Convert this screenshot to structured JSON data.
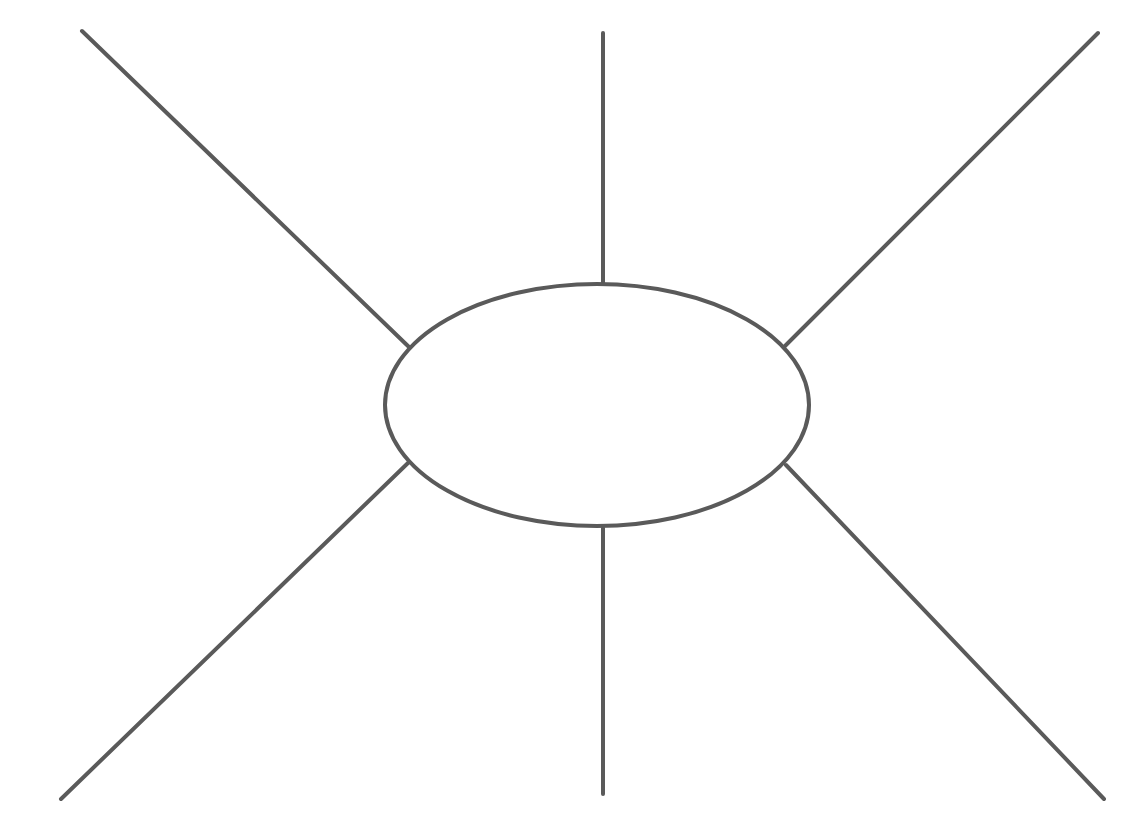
{
  "diagram": {
    "type": "spider-map",
    "stroke_color": "#5a5a5a",
    "stroke_width": 4,
    "background": "#ffffff",
    "center_ellipse": {
      "cx": 597,
      "cy": 405,
      "rx": 212,
      "ry": 121,
      "label": ""
    },
    "spokes": [
      {
        "name": "spoke-top-left",
        "x1": 82,
        "y1": 31,
        "x2": 409,
        "y2": 347,
        "label": ""
      },
      {
        "name": "spoke-top",
        "x1": 603,
        "y1": 33,
        "x2": 603,
        "y2": 284,
        "label": ""
      },
      {
        "name": "spoke-top-right",
        "x1": 1098,
        "y1": 33,
        "x2": 785,
        "y2": 346,
        "label": ""
      },
      {
        "name": "spoke-bottom-left",
        "x1": 61,
        "y1": 799,
        "x2": 408,
        "y2": 463,
        "label": ""
      },
      {
        "name": "spoke-bottom",
        "x1": 603,
        "y1": 794,
        "x2": 603,
        "y2": 528,
        "label": ""
      },
      {
        "name": "spoke-bottom-right",
        "x1": 1104,
        "y1": 799,
        "x2": 786,
        "y2": 465,
        "label": ""
      }
    ]
  }
}
